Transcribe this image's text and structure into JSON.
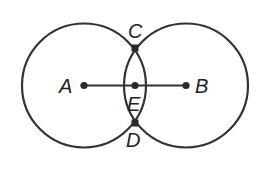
{
  "diagram": {
    "type": "geometry-construction",
    "colors": {
      "stroke": "#333333",
      "point": "#2a2a2a",
      "label": "#222222",
      "background": "#ffffff"
    },
    "circles": [
      {
        "name": "circle-A",
        "center": "A",
        "cx": 84,
        "cy": 85.5,
        "r": 62
      },
      {
        "name": "circle-B",
        "center": "B",
        "cx": 186,
        "cy": 85.5,
        "r": 62
      }
    ],
    "segments": [
      {
        "name": "segment-AB",
        "from": "A",
        "to": "B"
      }
    ],
    "points": [
      {
        "id": "A",
        "label": "A",
        "x": 84,
        "y": 85.5
      },
      {
        "id": "B",
        "label": "B",
        "x": 186,
        "y": 85.5
      },
      {
        "id": "C",
        "label": "C",
        "x": 135,
        "y": 48
      },
      {
        "id": "D",
        "label": "D",
        "x": 135,
        "y": 123
      },
      {
        "id": "E",
        "label": "E",
        "x": 135,
        "y": 85.5
      }
    ],
    "labels": {
      "A": "A",
      "B": "B",
      "C": "C",
      "D": "D",
      "E": "E"
    }
  }
}
